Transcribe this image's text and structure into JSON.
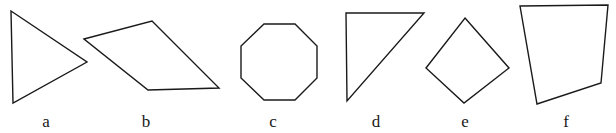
{
  "figure": {
    "background_color": "#ffffff",
    "stroke_color": "#1a1a1a",
    "stroke_width": 1.4,
    "width": 616,
    "height": 133
  },
  "shapes": [
    {
      "id": "shape-a",
      "label": "a",
      "name": "triangle",
      "sides": 3,
      "points": "11,11 87,62 13,103",
      "label_x": 46,
      "label_y": 127
    },
    {
      "id": "shape-b",
      "label": "b",
      "name": "quadrilateral",
      "sides": 4,
      "points": "84,39 152,21 219,88 148,90",
      "label_x": 146,
      "label_y": 127
    },
    {
      "id": "shape-c",
      "label": "c",
      "name": "octagon",
      "sides": 8,
      "points": "264,24 295,24 317,46 317,78 295,100 264,100 241,78 241,46",
      "label_x": 273,
      "label_y": 127
    },
    {
      "id": "shape-d",
      "label": "d",
      "name": "right-triangle",
      "sides": 3,
      "points": "346,13 424,13 347,101",
      "label_x": 376,
      "label_y": 127
    },
    {
      "id": "shape-e",
      "label": "e",
      "name": "diamond",
      "sides": 4,
      "points": "465,18 509,68 464,103 426,68",
      "label_x": 465,
      "label_y": 127
    },
    {
      "id": "shape-f",
      "label": "f",
      "name": "trapezoid",
      "sides": 4,
      "points": "520,6 608,5 601,83 537,104",
      "label_x": 566,
      "label_y": 127
    }
  ]
}
